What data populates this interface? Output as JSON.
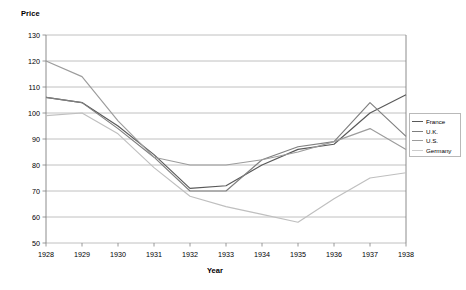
{
  "chart_data": {
    "type": "line",
    "title": "",
    "xlabel": "Year",
    "ylabel": "Price",
    "x": [
      1928,
      1929,
      1930,
      1931,
      1932,
      1933,
      1934,
      1935,
      1936,
      1937,
      1938
    ],
    "categories": [
      "1928",
      "1929",
      "1930",
      "1931",
      "1932",
      "1933",
      "1934",
      "1935",
      "1936",
      "1937",
      "1938"
    ],
    "ylim": [
      50,
      130
    ],
    "yticks": [
      50,
      60,
      70,
      80,
      90,
      100,
      110,
      120,
      130
    ],
    "grid": true,
    "legend_position": "right",
    "series": [
      {
        "name": "France",
        "color": "#595959",
        "values": [
          106,
          104,
          95,
          84,
          71,
          72,
          80,
          86,
          88,
          100,
          107
        ]
      },
      {
        "name": "U.K.",
        "color": "#7f7f7f",
        "values": [
          106,
          104,
          94,
          83,
          70,
          70,
          82,
          87,
          89,
          104,
          91
        ]
      },
      {
        "name": "U.S.",
        "color": "#9c9c9c",
        "values": [
          120,
          114,
          97,
          83,
          80,
          80,
          82,
          85,
          89,
          94,
          86
        ]
      },
      {
        "name": "Germany",
        "color": "#bfbfbf",
        "values": [
          99,
          100,
          92,
          79,
          68,
          64,
          61,
          58,
          67,
          75,
          77
        ]
      }
    ]
  },
  "legend": {
    "items": [
      {
        "label": "France",
        "color": "#595959"
      },
      {
        "label": "U.K.",
        "color": "#7f7f7f"
      },
      {
        "label": "U.S.",
        "color": "#9c9c9c"
      },
      {
        "label": "Germany",
        "color": "#cccccc"
      }
    ]
  },
  "axes": {
    "y_title": "Price",
    "x_title": "Year",
    "y_tick_labels": [
      "130",
      "120",
      "110",
      "100",
      "90",
      "80",
      "70",
      "60",
      "50"
    ],
    "x_tick_labels": [
      "1928",
      "1929",
      "1930",
      "1931",
      "1932",
      "1933",
      "1934",
      "1935",
      "1936",
      "1937",
      "1938"
    ]
  },
  "style": {
    "background": "#ffffff",
    "gridline_color": "#b0b0b0",
    "axis_color": "#808080"
  }
}
